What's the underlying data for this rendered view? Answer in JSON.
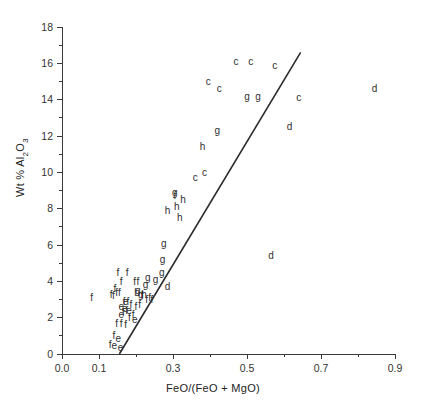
{
  "chart_data": {
    "type": "scatter",
    "title": "",
    "xlabel": "FeO/(FeO + MgO)",
    "ylabel": "Wt % Al2O3",
    "ylabel_html": "Wt % Al<sub>2</sub>O<sub>3</sub>",
    "xlim": [
      0.0,
      0.9
    ],
    "ylim": [
      0,
      18
    ],
    "xticks": [
      0.0,
      0.1,
      0.3,
      0.5,
      0.7,
      0.9
    ],
    "xtick_labels": [
      "0.0",
      "0.1",
      "0.3",
      "0.5",
      "0.7",
      "0.9"
    ],
    "xticks_minor": [
      0.2,
      0.4,
      0.6,
      0.8
    ],
    "yticks": [
      0,
      2,
      4,
      6,
      8,
      10,
      12,
      14,
      16,
      18
    ],
    "ytick_labels": [
      "0",
      "2",
      "4",
      "6",
      "8",
      "10",
      "12",
      "14",
      "16",
      "18"
    ],
    "yticks_minor": [
      1,
      3,
      5,
      7,
      9,
      11,
      13,
      15,
      17
    ],
    "grid": false,
    "legend": "none",
    "marker_style": "letter-labels",
    "point_color": "#2f2f2f",
    "axis_color": "#3a3a3a",
    "line_color": "#2b2b2b",
    "trend_line": {
      "label": "reference-line",
      "x0": 0.155,
      "y0": 0.0,
      "x1": 0.645,
      "y1": 16.6
    },
    "series": [
      {
        "name": "c",
        "label": "c",
        "points": [
          [
            0.395,
            15.0
          ],
          [
            0.47,
            16.1
          ],
          [
            0.51,
            16.1
          ],
          [
            0.575,
            15.9
          ],
          [
            0.425,
            14.6
          ],
          [
            0.64,
            14.1
          ],
          [
            0.385,
            10.0
          ],
          [
            0.36,
            9.7
          ]
        ]
      },
      {
        "name": "d",
        "label": "d",
        "points": [
          [
            0.845,
            14.6
          ],
          [
            0.615,
            12.5
          ],
          [
            0.565,
            5.4
          ],
          [
            0.285,
            3.7
          ]
        ]
      },
      {
        "name": "g",
        "label": "g",
        "points": [
          [
            0.5,
            14.2
          ],
          [
            0.53,
            14.2
          ],
          [
            0.42,
            12.3
          ],
          [
            0.305,
            8.9
          ],
          [
            0.275,
            6.1
          ],
          [
            0.272,
            5.2
          ],
          [
            0.27,
            4.5
          ],
          [
            0.253,
            4.1
          ],
          [
            0.232,
            4.2
          ],
          [
            0.226,
            3.8
          ],
          [
            0.205,
            3.5
          ],
          [
            0.213,
            3.3
          ]
        ]
      },
      {
        "name": "h",
        "label": "h",
        "points": [
          [
            0.38,
            11.4
          ],
          [
            0.327,
            8.5
          ],
          [
            0.31,
            8.1
          ],
          [
            0.285,
            7.9
          ],
          [
            0.318,
            7.5
          ],
          [
            0.203,
            3.4
          ],
          [
            0.222,
            3.3
          ]
        ]
      },
      {
        "name": "f",
        "label": "f",
        "points": [
          [
            0.305,
            8.7
          ],
          [
            0.08,
            3.1
          ],
          [
            0.151,
            4.5
          ],
          [
            0.176,
            4.5
          ],
          [
            0.16,
            4.0
          ],
          [
            0.143,
            3.6
          ],
          [
            0.148,
            3.4
          ],
          [
            0.155,
            3.4
          ],
          [
            0.133,
            3.3
          ],
          [
            0.139,
            3.2
          ],
          [
            0.196,
            4.0
          ],
          [
            0.205,
            4.0
          ],
          [
            0.237,
            3.1
          ],
          [
            0.243,
            3.0
          ],
          [
            0.229,
            3.0
          ],
          [
            0.216,
            3.2
          ],
          [
            0.168,
            2.9
          ],
          [
            0.178,
            2.9
          ],
          [
            0.186,
            2.7
          ],
          [
            0.2,
            2.6
          ],
          [
            0.21,
            2.7
          ],
          [
            0.192,
            2.2
          ],
          [
            0.182,
            2.0
          ],
          [
            0.16,
            1.7
          ],
          [
            0.172,
            1.6
          ],
          [
            0.148,
            1.7
          ],
          [
            0.14,
            1.0
          ],
          [
            0.13,
            0.5
          ],
          [
            0.166,
            2.3
          ],
          [
            0.175,
            2.4
          ]
        ]
      },
      {
        "name": "e",
        "label": "e",
        "points": [
          [
            0.16,
            2.6
          ],
          [
            0.17,
            2.5
          ],
          [
            0.16,
            2.2
          ],
          [
            0.181,
            2.4
          ],
          [
            0.197,
            1.9
          ],
          [
            0.152,
            0.85
          ],
          [
            0.141,
            0.45
          ],
          [
            0.158,
            0.35
          ],
          [
            0.172,
            2.9
          ]
        ]
      }
    ]
  }
}
